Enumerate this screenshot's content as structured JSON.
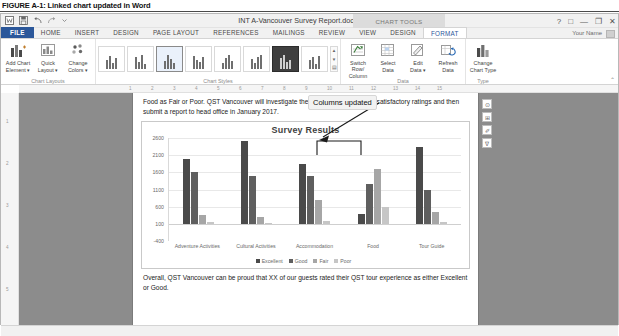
{
  "figure": {
    "caption": "FIGURE A-1: Linked chart updated in Word"
  },
  "window": {
    "title": "INT A-Vancouver Survey Report.docx - Word",
    "context_banner": "CHART TOOLS",
    "account_name": "Your Name",
    "quick_access": [
      {
        "name": "word-logo-icon",
        "label": "W"
      },
      {
        "name": "save-icon",
        "label": "Save"
      },
      {
        "name": "undo-icon",
        "label": "Undo"
      },
      {
        "name": "redo-icon",
        "label": "Redo"
      },
      {
        "name": "customize-qat-icon",
        "label": "Customize Quick Access Toolbar"
      }
    ],
    "controls": [
      {
        "name": "help-button",
        "glyph": "?"
      },
      {
        "name": "ribbon-display-options-button",
        "glyph": "□"
      },
      {
        "name": "minimize-button",
        "glyph": "—"
      },
      {
        "name": "restore-button",
        "glyph": "❐"
      },
      {
        "name": "close-button",
        "glyph": "✕"
      }
    ]
  },
  "tabs": {
    "file": "FILE",
    "main": [
      "HOME",
      "INSERT",
      "DESIGN",
      "PAGE LAYOUT",
      "REFERENCES",
      "MAILINGS",
      "REVIEW",
      "VIEW"
    ],
    "contextual": [
      "DESIGN",
      "FORMAT"
    ],
    "active_contextual": "FORMAT"
  },
  "ribbon": {
    "collapse_label": "⌃",
    "groups": [
      {
        "name": "chart-layouts",
        "label": "Chart Layouts",
        "buttons": [
          {
            "name": "add-chart-element-button",
            "label": "Add Chart\nElement ▾",
            "line1": "Add Chart",
            "line2": "Element ▾",
            "icon": "chart-element-icon"
          },
          {
            "name": "quick-layout-button",
            "label": "Quick Layout",
            "line1": "Quick",
            "line2": "Layout ▾",
            "icon": "quick-layout-icon"
          }
        ]
      },
      {
        "name": "chart-styles-color",
        "label": "",
        "buttons": [
          {
            "name": "change-colors-button",
            "label": "Change Colors",
            "line1": "Change",
            "line2": "Colors ▾",
            "icon": "palette-icon"
          }
        ]
      },
      {
        "name": "chart-styles",
        "label": "Chart Styles",
        "buttons": []
      },
      {
        "name": "data",
        "label": "Data",
        "buttons": [
          {
            "name": "switch-row-column-button",
            "line1": "Switch Row/",
            "line2": "Column",
            "icon": "switch-row-column-icon"
          },
          {
            "name": "select-data-button",
            "line1": "Select",
            "line2": "Data",
            "icon": "select-data-icon"
          },
          {
            "name": "edit-data-button",
            "line1": "Edit",
            "line2": "Data ▾",
            "icon": "edit-data-icon"
          },
          {
            "name": "refresh-data-button",
            "line1": "Refresh",
            "line2": "Data",
            "icon": "refresh-data-icon"
          }
        ]
      },
      {
        "name": "type",
        "label": "Type",
        "buttons": [
          {
            "name": "change-chart-type-button",
            "line1": "Change",
            "line2": "Chart Type",
            "icon": "change-chart-type-icon"
          }
        ]
      }
    ],
    "gallery_count": 8,
    "gallery_selected_index": 2
  },
  "ruler": {
    "h_ticks": [
      "1",
      "2",
      "3",
      "4",
      "5",
      "6",
      "7",
      "8",
      "9",
      "10",
      "11",
      "12",
      "13",
      "14",
      "15"
    ],
    "v_ticks": [
      "1",
      "2",
      "3",
      "4",
      "5"
    ]
  },
  "document": {
    "paragraph_top": "Food as Fair or Poor. QST Vancouver will investigate the reasons for these less satisfactory ratings and then submit a report to head office in January 2017.",
    "paragraph_top_underlined_word": "Fair",
    "paragraph_bottom": "Overall, QST Vancouver can be proud that XX of our guests rated their QST tour experience as either Excellent or Good."
  },
  "callout": {
    "text": "Columns updated"
  },
  "chart_side_tools": [
    {
      "name": "chart-elements-button",
      "glyph": "⊞"
    },
    {
      "name": "chart-styles-button",
      "glyph": "✐"
    },
    {
      "name": "chart-filters-button",
      "glyph": "∇"
    }
  ],
  "status_bar": {
    "items": []
  },
  "chart_data": {
    "type": "bar",
    "title": "Survey Results",
    "xlabel": "",
    "ylabel": "",
    "ylim": [
      -400,
      2600
    ],
    "yticks": [
      2600,
      2100,
      1600,
      1100,
      600,
      100,
      -400
    ],
    "grid": true,
    "legend_position": "bottom",
    "categories": [
      "Adventure Activities",
      "Cultural Activities",
      "Accommodation",
      "Food",
      "Tour Guide"
    ],
    "series": [
      {
        "name": "Excellent",
        "color": "#4a4a4a",
        "values": [
          2000,
          2500,
          1850,
          400,
          2350
        ]
      },
      {
        "name": "Good",
        "color": "#5f5f5f",
        "values": [
          1600,
          1500,
          1500,
          1250,
          1100
        ]
      },
      {
        "name": "Fair",
        "color": "#a6a6a6",
        "values": [
          350,
          300,
          800,
          1700,
          450
        ]
      },
      {
        "name": "Poor",
        "color": "#c6c6c6",
        "values": [
          150,
          120,
          180,
          600,
          150
        ]
      }
    ],
    "annotations": [
      {
        "name": "food-columns-bracket",
        "type": "bracket",
        "target_category": "Food",
        "note": "Columns updated"
      },
      {
        "name": "callout-arrow",
        "type": "arrow",
        "from": "Columns updated callout",
        "to": "Food bracket"
      }
    ]
  }
}
